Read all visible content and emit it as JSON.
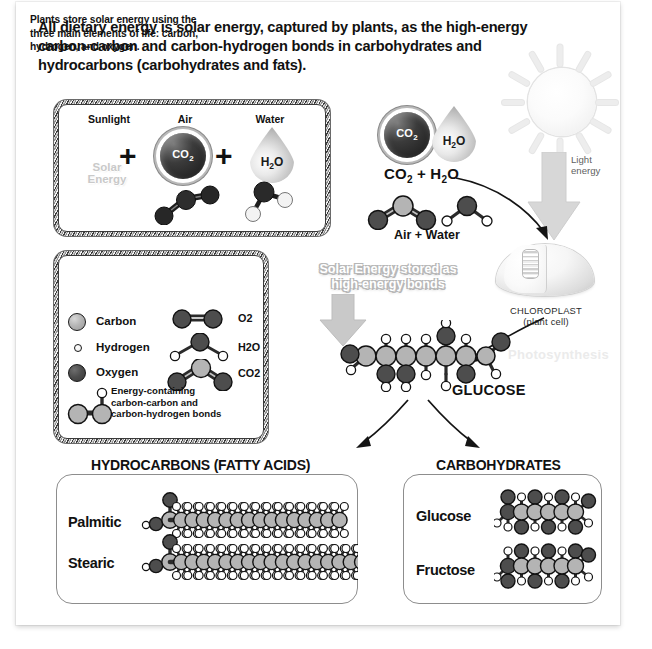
{
  "title": "All dietary energy is solar energy, captured by plants, as the high-energy carbon-carbon and carbon-hydrogen bonds in carbohydrates and hydrocarbons (carbohydrates and fats).",
  "equation_box": {
    "sunlight_label": "Sunlight",
    "air_label": "Air",
    "water_label": "Water",
    "plus_1": "+",
    "plus_2": "+",
    "co2_ball": "CO",
    "co2_ball_sub": "2",
    "water_drop": "H",
    "water_drop_sub": "2",
    "water_drop_end": "O",
    "solar_energy": "Solar\nEnergy"
  },
  "legend": {
    "intro": "Plants store solar energy using the three main elements of life: carbon, hydrogen, and oxygen.",
    "atoms": [
      {
        "label": "Carbon",
        "type": "carbon"
      },
      {
        "label": "Hydrogen",
        "type": "hydrogen"
      },
      {
        "label": "Oxygen",
        "type": "oxygen"
      }
    ],
    "molecules": [
      {
        "label": "O2"
      },
      {
        "label": "H2O"
      },
      {
        "label": "CO2"
      }
    ],
    "bond_note": "Energy-containing carbon-carbon and carbon-hydrogen bonds"
  },
  "middle": {
    "co2_h2o_label": "CO",
    "co2_h2o_sub1": "2",
    "co2_h2o_mid": " + H",
    "co2_h2o_sub2": "2",
    "co2_h2o_end": "O",
    "air_water_label": "Air + Water",
    "solar_stored_label": "Solar Energy stored as high-energy bonds",
    "glucose_label": "GLUCOSE"
  },
  "sun": {
    "light_energy_label": "Light\nenergy"
  },
  "chloroplast": {
    "name": "CHLOROPLAST",
    "sub": "(plant cell)",
    "watermark": "Photosynthesis"
  },
  "bottom": {
    "hydrocarbons_heading": "HYDROCARBONS (FATTY ACIDS)",
    "carbohydrates_heading": "CARBOHYDRATES",
    "hydrocarbon_molecules": [
      {
        "name": "Palmitic",
        "carbons": 16
      },
      {
        "name": "Stearic",
        "carbons": 18
      }
    ],
    "carbohydrate_molecules": [
      {
        "name": "Glucose",
        "carbons": 6
      },
      {
        "name": "Fructose",
        "carbons": 6
      }
    ]
  },
  "colors": {
    "carbon": "#b4b4b4",
    "oxygen": "#4d4d4d",
    "hydrogen": "#ffffff",
    "bond": "#2b2b2b",
    "text": "#111111",
    "arrow_gray": "#c9c9c9"
  }
}
